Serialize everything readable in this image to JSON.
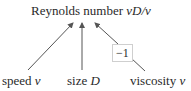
{
  "title": {
    "text": "Reynolds number ",
    "formula": "vD/ν"
  },
  "inputs": [
    {
      "label": "speed ",
      "symbol": "v"
    },
    {
      "label": "size ",
      "symbol": "D"
    },
    {
      "label": "viscosity ",
      "symbol": "ν"
    }
  ],
  "exponent_box": "−1"
}
